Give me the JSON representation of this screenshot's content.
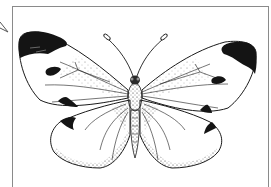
{
  "illustration": {
    "subject": "Large White butterfly (dorsal view), pen-and-stipple drawing",
    "colors": {
      "ink": "#1a1a1a",
      "paper": "#ffffff",
      "frame": "#8a8a8a"
    }
  }
}
